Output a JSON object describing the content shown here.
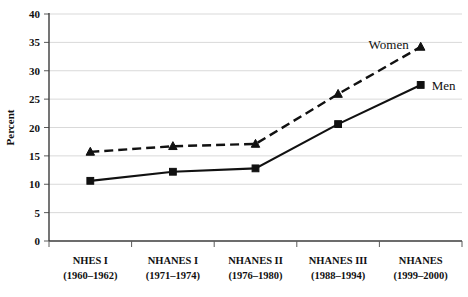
{
  "chart_data": {
    "type": "line",
    "title": "",
    "subtitle": "",
    "xlabel": "",
    "ylabel": "Percent",
    "ylim": [
      0,
      40
    ],
    "ytick_step": 5,
    "yticks": [
      "0",
      "5",
      "10",
      "15",
      "20",
      "25",
      "30",
      "35",
      "40"
    ],
    "grid": true,
    "legend_position": "inline-annotation",
    "categories": [
      "NHES I (1960–1962)",
      "NHANES I (1971–1974)",
      "NHANES II (1976–1980)",
      "NHANES III (1988–1994)",
      "NHANES (1999–2000)"
    ],
    "category_lines": [
      {
        "name": "NHES I",
        "years": "(1960–1962)"
      },
      {
        "name": "NHANES I",
        "years": "(1971–1974)"
      },
      {
        "name": "NHANES II",
        "years": "(1976–1980)"
      },
      {
        "name": "NHANES III",
        "years": "(1988–1994)"
      },
      {
        "name": "NHANES",
        "years": "(1999–2000)"
      }
    ],
    "series": [
      {
        "name": "Women",
        "values": [
          15.7,
          16.7,
          17.1,
          25.9,
          34.2
        ],
        "marker": "triangle",
        "line_style": "dashed",
        "color": "#111111"
      },
      {
        "name": "Men",
        "values": [
          10.6,
          12.2,
          12.8,
          20.6,
          27.5
        ],
        "marker": "square",
        "line_style": "solid",
        "color": "#111111"
      }
    ],
    "annotations": [
      {
        "text": "Women",
        "series": "Women"
      },
      {
        "text": "Men",
        "series": "Men"
      }
    ]
  },
  "axis": {
    "y_title": "Percent"
  },
  "colors": {
    "ink": "#111111",
    "gridline": "#d9d9d9",
    "axis": "#3b3b3b",
    "background": "#ffffff"
  }
}
